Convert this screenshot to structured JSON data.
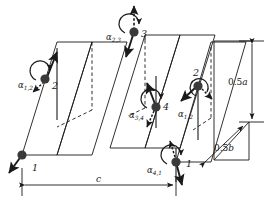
{
  "figure": {
    "type": "magnetic-structure-diagram",
    "background_color": "#ffffff",
    "line_color": "#1a1a1a",
    "node_color": "#3a3a3a"
  },
  "sites": [
    {
      "id": "site-1-left",
      "label": "1",
      "x": 22,
      "y": 155
    },
    {
      "id": "site-2-left",
      "label": "2",
      "x": 45,
      "y": 79
    },
    {
      "id": "site-3-middle",
      "label": "3",
      "x": 134,
      "y": 32
    },
    {
      "id": "site-4-middle",
      "label": "4",
      "x": 156,
      "y": 107
    },
    {
      "id": "site-2-right",
      "label": "2",
      "x": 198,
      "y": 86
    },
    {
      "id": "site-1-right",
      "label": "1",
      "x": 176,
      "y": 162
    }
  ],
  "angles": [
    {
      "id": "angle-alpha-1-2-left",
      "base": "α",
      "sub": "1,2",
      "x": 24,
      "y": 84
    },
    {
      "id": "angle-alpha-2-3-middle",
      "base": "α",
      "sub": "2,3",
      "x": 111,
      "y": 36
    },
    {
      "id": "angle-alpha-3-4-middle",
      "base": "α",
      "sub": "3,4",
      "x": 134,
      "y": 114
    },
    {
      "id": "angle-alpha-1-2-right",
      "base": "α",
      "sub": "1,2",
      "x": 182,
      "y": 113
    },
    {
      "id": "angle-alpha-4-1-right",
      "base": "α",
      "sub": "4,1",
      "x": 152,
      "y": 169
    }
  ],
  "dimensions": [
    {
      "id": "dim-half-a",
      "base": "0.5",
      "italic": "a",
      "x": 236,
      "y": 82,
      "orientation": "vertical"
    },
    {
      "id": "dim-half-b",
      "base": "0.5",
      "italic": "b",
      "x": 221,
      "y": 148,
      "orientation": "diagonal"
    },
    {
      "id": "dim-c",
      "base": "",
      "italic": "c",
      "x": 100,
      "y": 184,
      "orientation": "horizontal"
    }
  ]
}
